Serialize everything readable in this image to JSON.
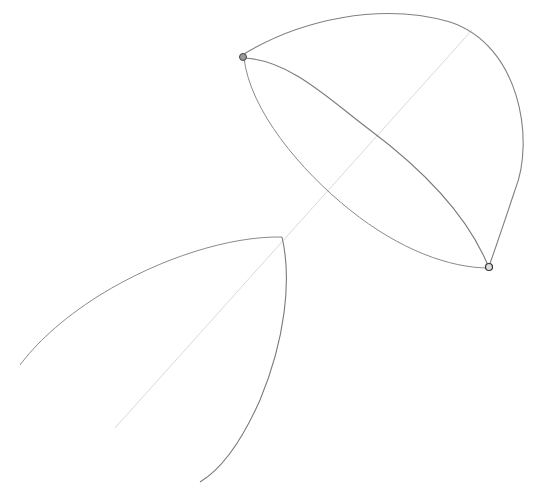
{
  "image": {
    "description": "Pencil sketch construction drawing: a half-dome/lens shape with two pinned endpoints, a diagonal central axis, and a pointed arch shape below",
    "background": "#ffffff",
    "stroke_color": "#7a7a7a",
    "axis_color": "#c8c8c8"
  }
}
